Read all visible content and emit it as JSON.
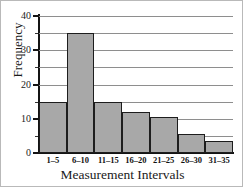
{
  "chart_data": {
    "type": "bar",
    "title": "",
    "xlabel": "Measurement Intervals",
    "ylabel": "Frequency",
    "categories": [
      "1–5",
      "6–10",
      "11–15",
      "16–20",
      "21–25",
      "26–30",
      "31–35"
    ],
    "values": [
      15,
      35,
      15,
      12,
      10.5,
      5.5,
      3.5
    ],
    "ylim": [
      0,
      40
    ],
    "ytick_labels": [
      "0",
      "10",
      "20",
      "30",
      "40"
    ],
    "ytick_values": [
      0,
      10,
      20,
      30,
      40
    ],
    "gridline_values": [
      5,
      10,
      15,
      20,
      25,
      30,
      35,
      40
    ],
    "minor_tick_values": [
      5,
      15,
      25,
      35
    ],
    "grid": true,
    "legend": "none",
    "bar_fill_color": "#a8a8a8",
    "bar_edge_color": "#1d1d1d",
    "gridline_color": "#8e8e8e",
    "axis_color": "#141414",
    "background_color": "#ffffff"
  }
}
